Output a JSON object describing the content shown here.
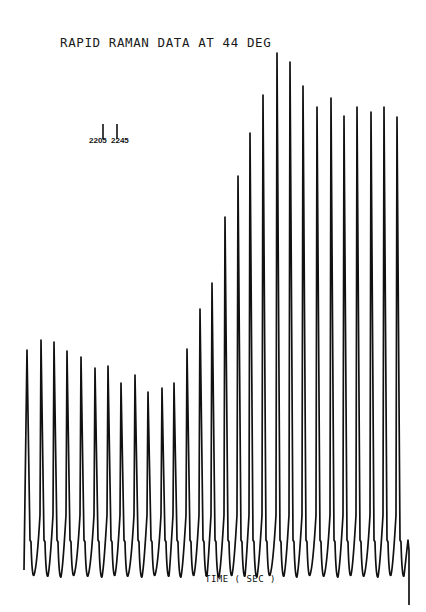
{
  "chart_data": {
    "type": "line",
    "title": "RAPID RAMAN DATA AT 44 DEG",
    "xlabel": "TIME ( SEC )",
    "ylabel": "",
    "grid": false,
    "legend": null,
    "annotations": [
      {
        "label": "2205",
        "note": "marker tick for 2205 cm-1 band"
      },
      {
        "label": "2245",
        "note": "marker tick for 2245 cm-1 band"
      }
    ],
    "x": [
      1,
      2,
      3,
      4,
      5,
      6,
      7,
      8,
      9,
      10,
      11,
      12,
      13,
      14,
      15,
      16,
      17,
      18,
      19,
      20,
      21,
      22,
      23,
      24,
      25,
      26,
      27,
      28,
      29
    ],
    "peak_x_px": [
      27,
      41,
      54,
      67,
      81,
      95,
      108,
      121,
      135,
      148,
      162,
      174,
      187,
      200,
      212,
      225,
      238,
      250,
      263,
      277,
      290,
      303,
      317,
      331,
      344,
      357,
      371,
      384,
      397
    ],
    "peak_top_px": [
      350,
      340,
      342,
      351,
      357,
      368,
      366,
      383,
      375,
      392,
      388,
      383,
      349,
      309,
      283,
      217,
      176,
      133,
      95,
      53,
      62,
      86,
      107,
      98,
      116,
      107,
      112,
      107,
      117
    ],
    "series": [
      {
        "name": "peak intensity (relative)",
        "values": [
          225,
          235,
          233,
          224,
          218,
          207,
          209,
          192,
          200,
          183,
          187,
          192,
          226,
          266,
          292,
          358,
          399,
          442,
          480,
          522,
          513,
          489,
          468,
          477,
          459,
          468,
          463,
          468,
          458
        ]
      }
    ],
    "baseline_px": 575,
    "shoulder_px": 540
  },
  "labels": {
    "title": "RAPID RAMAN DATA AT 44 DEG",
    "marker_a": "2205",
    "marker_b": "2245",
    "xlabel": "TIME ( SEC )"
  }
}
